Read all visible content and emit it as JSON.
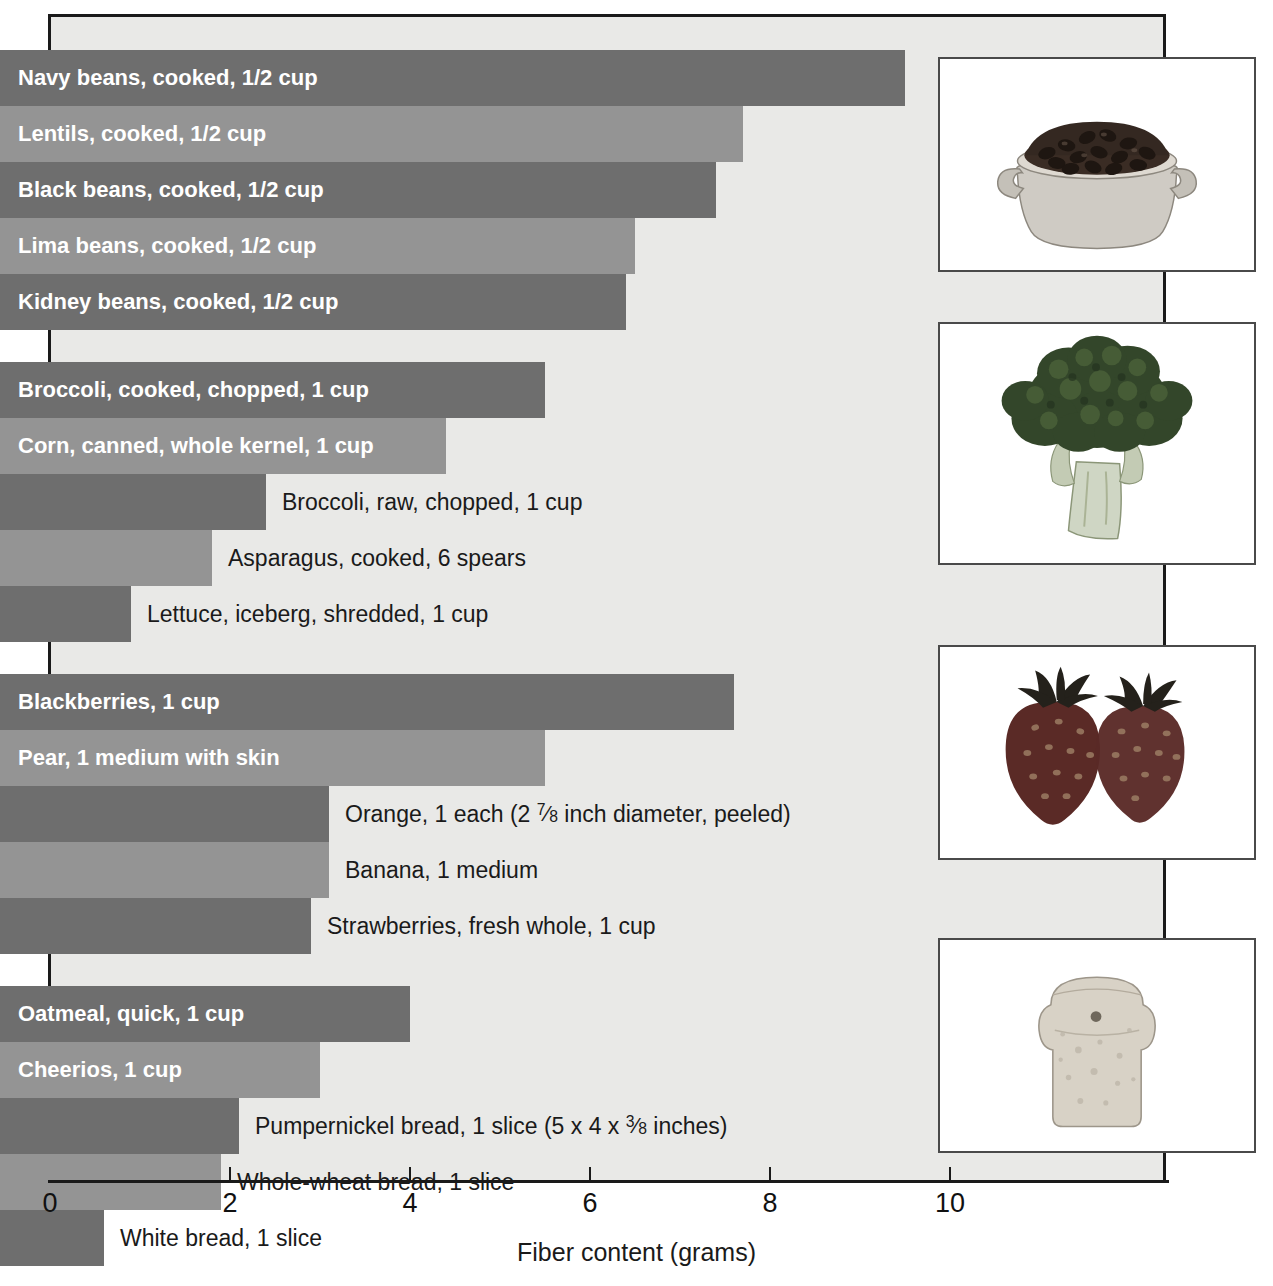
{
  "chart_data": {
    "type": "bar",
    "orientation": "horizontal",
    "title": "",
    "xlabel": "Fiber content (grams)",
    "ylabel": "",
    "xlim": [
      0,
      11.9
    ],
    "xticks": [
      0,
      2,
      4,
      6,
      8,
      10
    ],
    "xtick_labels": [
      "0",
      "2",
      "4",
      "6",
      "8",
      "10"
    ],
    "grid": false,
    "legend": null,
    "colors": {
      "bar_dark": "#6e6e6e",
      "bar_light": "#949494",
      "panel": "#e9e9e7",
      "axis": "#1a1a1a"
    },
    "groups": [
      {
        "name": "Legumes",
        "items": [
          {
            "label": "Navy beans, cooked, 1/2 cup",
            "value": 9.5,
            "shade": "dark",
            "label_inside": true
          },
          {
            "label": "Lentils, cooked, 1/2 cup",
            "value": 7.7,
            "shade": "light",
            "label_inside": true
          },
          {
            "label": "Black beans, cooked, 1/2 cup",
            "value": 7.4,
            "shade": "dark",
            "label_inside": true
          },
          {
            "label": "Lima beans, cooked, 1/2 cup",
            "value": 6.5,
            "shade": "light",
            "label_inside": true
          },
          {
            "label": "Kidney beans, cooked, 1/2 cup",
            "value": 6.4,
            "shade": "dark",
            "label_inside": true
          }
        ]
      },
      {
        "name": "Vegetables",
        "items": [
          {
            "label": "Broccoli, cooked, chopped, 1 cup",
            "value": 5.5,
            "shade": "dark",
            "label_inside": true
          },
          {
            "label": "Corn, canned, whole kernel, 1 cup",
            "value": 4.4,
            "shade": "light",
            "label_inside": true
          },
          {
            "label": "Broccoli, raw, chopped, 1 cup",
            "value": 2.4,
            "shade": "dark",
            "label_inside": false
          },
          {
            "label": "Asparagus, cooked, 6 spears",
            "value": 1.8,
            "shade": "light",
            "label_inside": false
          },
          {
            "label": "Lettuce, iceberg, shredded, 1 cup",
            "value": 0.9,
            "shade": "dark",
            "label_inside": false
          }
        ]
      },
      {
        "name": "Fruits",
        "items": [
          {
            "label": "Blackberries, 1 cup",
            "value": 7.6,
            "shade": "dark",
            "label_inside": true
          },
          {
            "label": "Pear, 1 medium with skin",
            "value": 5.5,
            "shade": "light",
            "label_inside": true
          },
          {
            "label": "Orange, 1 each (2 7/8 inch diameter, peeled)",
            "value": 3.1,
            "shade": "dark",
            "label_inside": false,
            "rich": "orange"
          },
          {
            "label": "Banana, 1 medium",
            "value": 3.1,
            "shade": "light",
            "label_inside": false
          },
          {
            "label": "Strawberries, fresh whole, 1 cup",
            "value": 2.9,
            "shade": "dark",
            "label_inside": false
          }
        ]
      },
      {
        "name": "Breads",
        "items": [
          {
            "label": "Oatmeal, quick, 1 cup",
            "value": 4.0,
            "shade": "dark",
            "label_inside": true
          },
          {
            "label": "Cheerios, 1 cup",
            "value": 3.0,
            "shade": "light",
            "label_inside": true
          },
          {
            "label": "Pumpernickel bread, 1 slice (5 x 4 x 3/8 inches)",
            "value": 2.1,
            "shade": "dark",
            "label_inside": false,
            "rich": "pumpernickel"
          },
          {
            "label": "Whole-wheat bread, 1 slice",
            "value": 1.9,
            "shade": "light",
            "label_inside": false
          },
          {
            "label": "White bread, 1 slice",
            "value": 0.6,
            "shade": "dark",
            "label_inside": false
          }
        ]
      }
    ]
  },
  "photos": [
    {
      "name": "beans-in-pot-photo",
      "alt": "Bowl of cooked black beans"
    },
    {
      "name": "broccoli-photo",
      "alt": "Head of broccoli"
    },
    {
      "name": "strawberries-photo",
      "alt": "Two strawberries"
    },
    {
      "name": "bread-slice-photo",
      "alt": "Slice of bread"
    }
  ]
}
